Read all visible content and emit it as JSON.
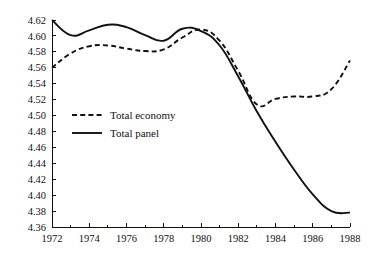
{
  "chart_data": {
    "type": "line",
    "title": "",
    "subtitle": "",
    "xlabel": "",
    "ylabel": "",
    "xlim": [
      1972,
      1988
    ],
    "ylim": [
      4.36,
      4.62
    ],
    "grid": false,
    "legend_position": "inside-left",
    "x_ticks": [
      1972,
      1974,
      1976,
      1978,
      1980,
      1982,
      1984,
      1986,
      1988
    ],
    "x_minor_ticks": [
      1973,
      1975,
      1977,
      1979,
      1981,
      1983,
      1985,
      1987
    ],
    "y_ticks": [
      4.36,
      4.38,
      4.4,
      4.42,
      4.44,
      4.46,
      4.48,
      4.5,
      4.52,
      4.54,
      4.56,
      4.58,
      4.6,
      4.62
    ],
    "x_tick_labels": [
      "1972",
      "1974",
      "1976",
      "1978",
      "1980",
      "1982",
      "1984",
      "1986",
      "1988"
    ],
    "y_tick_labels": [
      "4.36",
      "4.38",
      "4.40",
      "4.42",
      "4.44",
      "4.46",
      "4.48",
      "4.50",
      "4.52",
      "4.54",
      "4.56",
      "4.58",
      "4.60",
      "4.62"
    ],
    "x": [
      1972,
      1973,
      1974,
      1975,
      1976,
      1977,
      1978,
      1979,
      1980,
      1981,
      1982,
      1983,
      1984,
      1985,
      1986,
      1987,
      1988
    ],
    "series": [
      {
        "name": "Total economy",
        "style": "dashed",
        "color": "#111111",
        "values": [
          4.56,
          4.578,
          4.587,
          4.588,
          4.584,
          4.581,
          4.583,
          4.598,
          4.608,
          4.594,
          4.556,
          4.514,
          4.521,
          4.524,
          4.524,
          4.533,
          4.569
        ]
      },
      {
        "name": "Total panel",
        "style": "solid",
        "color": "#111111",
        "values": [
          4.62,
          4.601,
          4.607,
          4.614,
          4.611,
          4.601,
          4.594,
          4.609,
          4.606,
          4.588,
          4.549,
          4.505,
          4.467,
          4.432,
          4.401,
          4.38,
          4.378
        ]
      }
    ],
    "legend": [
      {
        "label": "Total economy",
        "style": "dashed"
      },
      {
        "label": "Total panel",
        "style": "solid"
      }
    ]
  },
  "axes_geometry": {
    "plot_left": 52,
    "plot_right": 350,
    "plot_top": 20,
    "plot_bottom": 227
  },
  "legend_box": {
    "x": 72,
    "y_economy": 115,
    "y_panel": 133,
    "swatch_width": 30
  }
}
